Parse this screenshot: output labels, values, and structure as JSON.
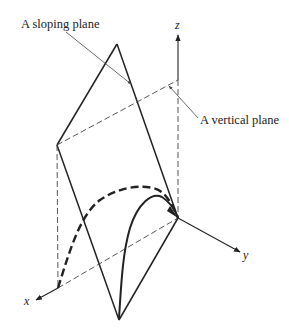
{
  "diagram": {
    "type": "3d-geometry-illustration",
    "labels": {
      "sloping_plane": "A sloping plane",
      "vertical_plane": "A vertical plane",
      "axis_x": "x",
      "axis_y": "y",
      "axis_z": "z"
    },
    "colors": {
      "ink": "#222222",
      "background": "#ffffff"
    },
    "points": {
      "origin": [
        178,
        218
      ],
      "top_apex": [
        117,
        44
      ],
      "left_vertex": [
        57,
        145
      ],
      "bottom_apex": [
        119,
        320
      ],
      "x_foot": [
        58,
        288
      ],
      "z_top_dash": [
        178,
        80
      ]
    },
    "elements": [
      "sloping-plane-rhombus",
      "vertical-plane-dashed-outline",
      "dashed-curve-in-vertical-plane",
      "solid-curve-in-sloping-plane",
      "x-axis",
      "y-axis",
      "z-axis"
    ]
  }
}
